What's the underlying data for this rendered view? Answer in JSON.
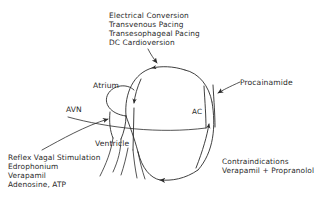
{
  "figure": {
    "background_color": "#ffffff",
    "ink_color": "#2a2a2a",
    "type": "medical-schematic"
  },
  "annotations": {
    "top_therapy": {
      "name": "electrical-therapy-list",
      "lines": [
        "Electrical Conversion",
        "Transvenous Pacing",
        "Transesophageal Pacing",
        "DC Cardioversion"
      ],
      "text": "Electrical Conversion\nTransvenous Pacing\nTransesophageal Pacing\nDC Cardioversion"
    },
    "right_drug": {
      "name": "procainamide-annotation",
      "text": "Procainamide"
    },
    "bottom_left_therapy": {
      "name": "vagal-and-drug-list",
      "lines": [
        "Reflex Vagal Stimulation",
        "Edrophonium",
        "Verapamil",
        "Adenosine, ATP"
      ],
      "text": "Reflex Vagal Stimulation\nEdrophonium\nVerapamil\nAdenosine, ATP"
    },
    "bottom_right_warning": {
      "name": "contraindications-note",
      "lines": [
        "Contraindications",
        "Verapamil + Propranolol"
      ],
      "text": "Contraindications\nVerapamil + Propranolol"
    }
  },
  "anatomy_labels": {
    "atrium": "Atrium",
    "avn": "AVN",
    "ac": "AC",
    "ventricle": "Ventricle"
  }
}
